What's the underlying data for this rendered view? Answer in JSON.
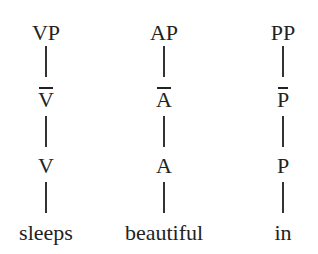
{
  "diagram": {
    "type": "syntax-trees",
    "trees": [
      {
        "phrase": "VP",
        "bar": "V",
        "head": "V",
        "word": "sleeps",
        "center_x": 46
      },
      {
        "phrase": "AP",
        "bar": "A",
        "head": "A",
        "word": "beautiful",
        "center_x": 164
      },
      {
        "phrase": "PP",
        "bar": "P",
        "head": "P",
        "word": "in",
        "center_x": 283
      }
    ]
  }
}
